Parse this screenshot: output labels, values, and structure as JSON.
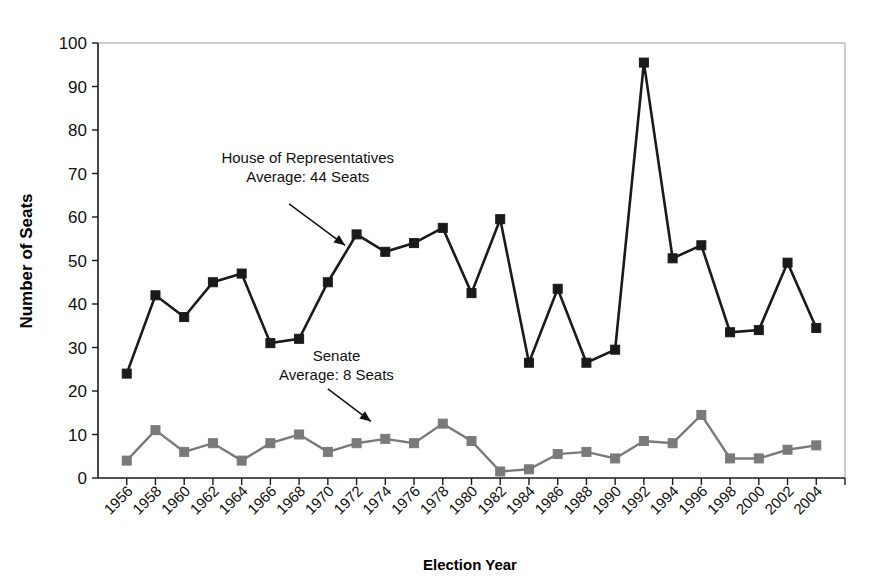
{
  "chart_data": {
    "type": "line",
    "title": "",
    "xlabel": "Election Year",
    "ylabel": "Number of Seats",
    "xlim": [
      1955,
      2005
    ],
    "ylim": [
      0,
      100
    ],
    "ytick_step": 10,
    "yticks": [
      0,
      10,
      20,
      30,
      40,
      50,
      60,
      70,
      80,
      90,
      100
    ],
    "grid": false,
    "legend_position": "inline-annotations",
    "categories": [
      1956,
      1958,
      1960,
      1962,
      1964,
      1966,
      1968,
      1970,
      1972,
      1974,
      1976,
      1978,
      1980,
      1982,
      1984,
      1986,
      1988,
      1990,
      1992,
      1994,
      1996,
      1998,
      2000,
      2002,
      2004
    ],
    "xtick_labels": [
      "1956",
      "1958",
      "1960",
      "1962",
      "1964",
      "1966",
      "1968",
      "1970",
      "1972",
      "1974",
      "1976",
      "1978",
      "1980",
      "1982",
      "1984",
      "1986",
      "1988",
      "1990",
      "1992",
      "1994",
      "1996",
      "1998",
      "2000",
      "2002",
      "2004"
    ],
    "series": [
      {
        "name": "House of Representatives",
        "color": "#1a1a1a",
        "marker": "square",
        "marker_color": "#1a1a1a",
        "line_width": 2.6,
        "marker_size": 9,
        "average": 44,
        "values": [
          24,
          42,
          37,
          45,
          47,
          31,
          32,
          45,
          56,
          52,
          54,
          57.5,
          42.5,
          59.5,
          26.5,
          43.5,
          26.5,
          29.5,
          95.5,
          50.5,
          53.5,
          33.5,
          34,
          49.5,
          34.5
        ]
      },
      {
        "name": "Senate",
        "color": "#7a7a7a",
        "marker": "square",
        "marker_color": "#7a7a7a",
        "line_width": 2.4,
        "marker_size": 9,
        "average": 8,
        "values": [
          4,
          11,
          6,
          8,
          4,
          8,
          10,
          6,
          8,
          9,
          8,
          12.5,
          8.5,
          1.5,
          2,
          5.5,
          6,
          4.5,
          8.5,
          8,
          14.5,
          4.5,
          4.5,
          6.5,
          7.5
        ]
      }
    ],
    "annotations": [
      {
        "id": "house-annotation",
        "lines": [
          "House of Representatives",
          "Average: 44 Seats"
        ],
        "text_anchor": "middle",
        "text_x": 1968.6,
        "text_y": 72.5,
        "arrow_from": [
          1967.3,
          63.0
        ],
        "arrow_to": [
          1971.2,
          53.5
        ]
      },
      {
        "id": "senate-annotation",
        "lines": [
          "Senate",
          "Average: 8 Seats"
        ],
        "text_anchor": "middle",
        "text_x": 1970.6,
        "text_y": 27.0,
        "arrow_from": [
          1970.0,
          20.5
        ],
        "arrow_to": [
          1973.0,
          13.0
        ]
      }
    ]
  },
  "figure": {
    "caption": ""
  }
}
